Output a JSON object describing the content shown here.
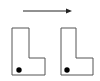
{
  "diagram": {
    "colors": {
      "stroke": "#555555",
      "arrow": "#222222",
      "dot": "#000000",
      "background": "#ffffff"
    },
    "arrow": {
      "x1": 23,
      "y1": 11,
      "x2": 72,
      "y2": 11,
      "direction": "right"
    },
    "shapes": [
      {
        "id": "left-L",
        "points": "12,28 29,28 29,58 45,58 45,75 12,75",
        "dot": {
          "cx": 19,
          "cy": 70,
          "r": 2.7
        }
      },
      {
        "id": "right-L",
        "points": "61,28 76,28 76,58 93,58 93,75 61,75",
        "dot": {
          "cx": 67,
          "cy": 70,
          "r": 2.7
        }
      }
    ]
  }
}
